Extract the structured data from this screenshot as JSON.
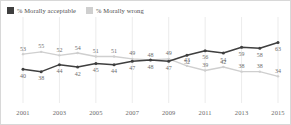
{
  "legend": {
    "position": "top-left",
    "items": [
      {
        "label": "% Morally acceptable",
        "color": "#3f3f3f",
        "icon": "square-swatch-icon"
      },
      {
        "label": "% Morally wrong",
        "color": "#cfcfcf",
        "icon": "square-swatch-icon"
      }
    ]
  },
  "chart_data": {
    "type": "line",
    "title": "",
    "subtitle": "",
    "xlabel": "",
    "ylabel": "",
    "grid": true,
    "legend_position": "top-left",
    "x": [
      2001,
      2002,
      2003,
      2004,
      2005,
      2006,
      2007,
      2008,
      2009,
      2010,
      2011,
      2012,
      2013,
      2014,
      2015
    ],
    "tick_labels": [
      "2001",
      "2003",
      "2005",
      "2007",
      "2009",
      "2011",
      "2013",
      "2015"
    ],
    "tick_values": [
      2001,
      2003,
      2005,
      2007,
      2009,
      2011,
      2013,
      2015
    ],
    "xlim": [
      2001,
      2015
    ],
    "ylim": [
      30,
      66
    ],
    "series": [
      {
        "name": "% Morally acceptable",
        "color": "#3f3f3f",
        "label_position": "below",
        "values": [
          40,
          38,
          44,
          42,
          45,
          44,
          47,
          48,
          47,
          52,
          56,
          54,
          59,
          58,
          63
        ]
      },
      {
        "name": "% Morally wrong",
        "color": "#cfcfcf",
        "label_position": "above",
        "values": [
          53,
          55,
          52,
          54,
          51,
          51,
          49,
          48,
          49,
          43,
          39,
          42,
          38,
          38,
          34
        ]
      }
    ]
  }
}
